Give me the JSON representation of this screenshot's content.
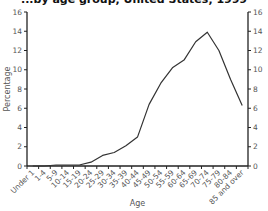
{
  "chart_data": {
    "type": "line",
    "title": "...by age group, United States, 1999",
    "xlabel": "Age",
    "ylabel": "Percentage",
    "ylim": [
      0,
      16
    ],
    "yticks": [
      0,
      2,
      4,
      6,
      8,
      10,
      12,
      14,
      16
    ],
    "secondary_y_axis": true,
    "grid": false,
    "categories": [
      "Under 1",
      "1-4",
      "5-9",
      "10-14",
      "15-19",
      "20-24",
      "25-29",
      "30-34",
      "35-39",
      "40-44",
      "45-49",
      "50-54",
      "55-59",
      "60-64",
      "65-69",
      "70-74",
      "75-79",
      "80-84",
      "85 and over"
    ],
    "series": [
      {
        "name": "Percentage",
        "values": [
          0,
          0,
          0.1,
          0.1,
          0.1,
          0.4,
          1.1,
          1.4,
          2.1,
          3.0,
          6.4,
          8.6,
          10.2,
          11.0,
          12.9,
          13.9,
          12.0,
          9.0,
          6.3
        ]
      }
    ]
  }
}
